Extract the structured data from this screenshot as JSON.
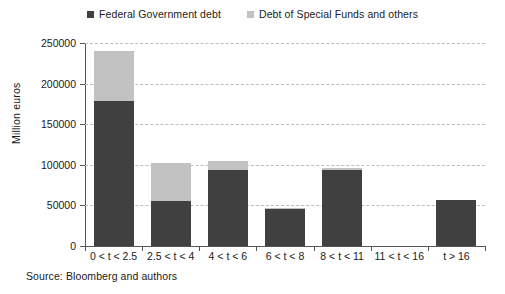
{
  "chart_data": {
    "type": "bar",
    "stacked": true,
    "title": "",
    "subtitle": "",
    "xlabel": "",
    "ylabel": "Million euros",
    "ylim": [
      0,
      250000
    ],
    "ytick_values": [
      0,
      50000,
      100000,
      150000,
      200000,
      250000
    ],
    "ytick_labels": [
      "0",
      "50000",
      "100000",
      "150000",
      "200000",
      "250000"
    ],
    "grid": true,
    "grid_axis": "y",
    "legend_position": "top-center",
    "categories": [
      "0 < t < 2.5",
      "2.5 < t < 4",
      "4 < t < 6",
      "6 < t < 8",
      "8 < t < 11",
      "11 < t < 16",
      "t > 16"
    ],
    "series": [
      {
        "name": "Federal Government debt",
        "color": "#404040",
        "values": [
          178000,
          55000,
          93000,
          45000,
          94000,
          0,
          57000
        ]
      },
      {
        "name": "Debt of Special Funds and others",
        "color": "#c2c2c2",
        "values": [
          62000,
          47000,
          12000,
          2000,
          2000,
          0,
          0
        ]
      }
    ],
    "totals": [
      240000,
      102000,
      105000,
      47000,
      96000,
      0,
      57000
    ],
    "annotations": []
  },
  "source": {
    "text": "Source: Bloomberg and authors"
  },
  "legend": {
    "entries": [
      {
        "label": "Federal Government debt",
        "color": "#404040"
      },
      {
        "label": "Debt of Special Funds and others",
        "color": "#c2c2c2"
      }
    ]
  },
  "colors": {
    "federal_debt": "#404040",
    "special_funds": "#c2c2c2",
    "gridline": "#bdbdbd",
    "axis": "#555555",
    "background": "#ffffff",
    "text": "#1a1a1a"
  }
}
